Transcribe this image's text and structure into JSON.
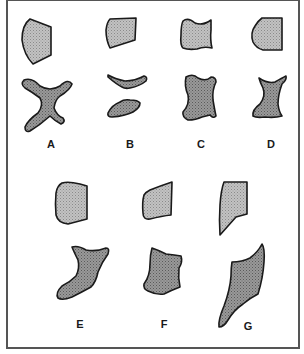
{
  "figure": {
    "type": "shape-transformation-comparison",
    "panels": [
      {
        "id": "A",
        "label": "A",
        "top_shape": "light-gray-rounded-quadrilateral",
        "bottom_shape": "dark-gray-four-pointed-star"
      },
      {
        "id": "B",
        "label": "B",
        "top_shape": "light-gray-rounded-quadrilateral",
        "bottom_shape": "two-dark-gray-thin-slivers"
      },
      {
        "id": "C",
        "label": "C",
        "top_shape": "light-gray-pinched-rectangle",
        "bottom_shape": "dark-gray-wavy-blob"
      },
      {
        "id": "D",
        "label": "D",
        "top_shape": "light-gray-d-shape",
        "bottom_shape": "dark-gray-hourglass"
      },
      {
        "id": "E",
        "label": "E",
        "top_shape": "light-gray-rounded-quadrilateral",
        "bottom_shape": "dark-gray-curved-boot"
      },
      {
        "id": "F",
        "label": "F",
        "top_shape": "light-gray-skewed-quadrilateral",
        "bottom_shape": "dark-gray-notched-block"
      },
      {
        "id": "G",
        "label": "G",
        "top_shape": "light-gray-tapered-wedge",
        "bottom_shape": "dark-gray-tapered-flame"
      }
    ],
    "colors": {
      "top_fill": "#b8b8b8",
      "bottom_fill": "#8c8c8c",
      "outline": "#1a1a1a",
      "frame": "#555555",
      "background": "#ffffff"
    }
  }
}
